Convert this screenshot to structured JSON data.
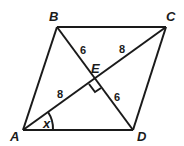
{
  "diagram": {
    "type": "parallelogram-with-diagonals",
    "vertices": {
      "A": {
        "label": "A",
        "x": 23,
        "y": 130
      },
      "B": {
        "label": "B",
        "x": 57,
        "y": 27
      },
      "C": {
        "label": "C",
        "x": 166,
        "y": 27
      },
      "D": {
        "label": "D",
        "x": 133,
        "y": 130
      },
      "E": {
        "label": "E",
        "x": 95,
        "y": 79
      }
    },
    "segment_labels": {
      "BE": "6",
      "EC": "8",
      "AE": "8",
      "ED": "6"
    },
    "angle_label": "x",
    "right_angle_at": "E"
  }
}
